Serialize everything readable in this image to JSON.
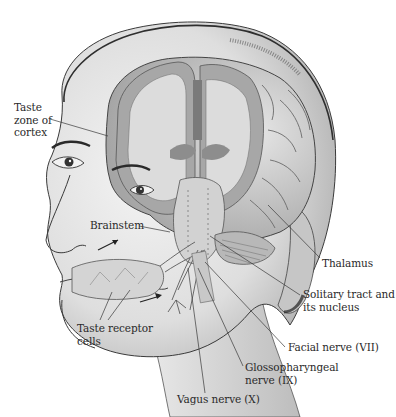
{
  "figure": {
    "colors": {
      "background": "#ffffff",
      "skin_light": "#ededed",
      "skin_mid": "#cfcfcf",
      "skin_shadow": "#9a9a9a",
      "brain_gray_matter": "#a8a8a8",
      "brain_white_matter": "#dcdcdc",
      "brain_dark": "#7a7a7a",
      "outline": "#3a3a3a",
      "label_text": "#2a2a2a",
      "leader_line": "#3a3a3a"
    }
  },
  "labels": {
    "taste_zone": {
      "lines": [
        "Taste",
        "zone of",
        "cortex"
      ]
    },
    "brainstem": {
      "text": "Brainstem"
    },
    "thalamus": {
      "text": "Thalamus"
    },
    "solitary_tract": {
      "lines": [
        "Solitary tract and",
        "its nucleus"
      ]
    },
    "facial_nerve": {
      "text": "Facial nerve (VII)"
    },
    "glossopharyngeal": {
      "lines": [
        "Glossopharyngeal",
        "nerve (IX)"
      ]
    },
    "vagus": {
      "text": "Vagus nerve (X)"
    },
    "taste_receptor": {
      "lines": [
        "Taste receptor",
        "cells"
      ]
    }
  }
}
